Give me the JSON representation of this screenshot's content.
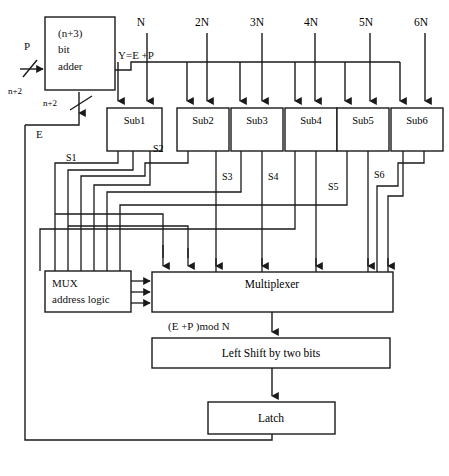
{
  "diagram": {
    "adder": {
      "line1": "(n+3)",
      "line2": "bit",
      "line3": "adder"
    },
    "inputs": {
      "p_label": "P",
      "p_width": "n+2",
      "e_label": "E",
      "e_width": "n+2"
    },
    "sum_label": "Y=E +P",
    "constants": [
      "N",
      "2N",
      "3N",
      "4N",
      "5N",
      "6N"
    ],
    "subtractors": [
      {
        "label": "Sub1",
        "signal": "S1"
      },
      {
        "label": "Sub2",
        "signal": "S2"
      },
      {
        "label": "Sub3",
        "signal": "S3"
      },
      {
        "label": "Sub4",
        "signal": "S4"
      },
      {
        "label": "Sub5",
        "signal": "S5"
      },
      {
        "label": "Sub6",
        "signal": "S6"
      }
    ],
    "mux_address_logic": {
      "line1": "MUX",
      "line2": "address logic"
    },
    "multiplexer": "Multiplexer",
    "mod_result": "(E +P )mod N",
    "left_shift": "Left Shift by two bits",
    "latch": "Latch",
    "colors": {
      "line": "#1a1a1a",
      "text": "#101010",
      "background": "#ffffff"
    }
  }
}
